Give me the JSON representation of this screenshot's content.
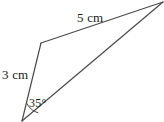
{
  "figure": {
    "type": "geometry-diagram",
    "background_color": "#ffffff",
    "stroke_color": "#4a4a4a",
    "text_color": "#1a1a1a",
    "vertices": {
      "bottom": {
        "x": 22,
        "y": 121
      },
      "bend": {
        "x": 41,
        "y": 43
      },
      "right": {
        "x": 163,
        "y": 2
      }
    },
    "sides": [
      {
        "name": "top-side",
        "label": "5 cm",
        "length_value": 5,
        "unit": "cm",
        "from": "bend",
        "to": "right"
      },
      {
        "name": "left-side",
        "label": "3 cm",
        "length_value": 3,
        "unit": "cm",
        "from": "bottom",
        "to": "bend"
      },
      {
        "name": "base-side",
        "label": "",
        "from": "bottom",
        "to": "right"
      }
    ],
    "angles": [
      {
        "name": "bottom-angle",
        "label": "35°",
        "value": 35,
        "unit": "degrees",
        "at_vertex": "bottom",
        "marker": "arc"
      }
    ]
  }
}
